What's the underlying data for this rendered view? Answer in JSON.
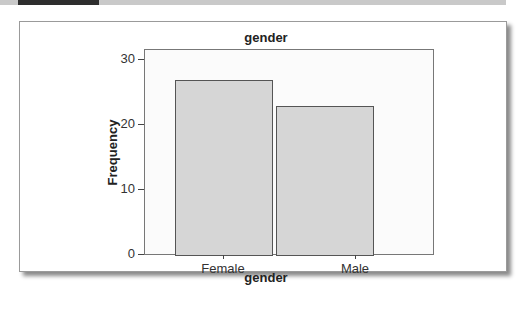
{
  "chart_data": {
    "type": "bar",
    "title": "gender",
    "categories": [
      "Female",
      "Male"
    ],
    "values": [
      27,
      23
    ],
    "xlabel": "gender",
    "ylabel": "Frequency",
    "ylim": [
      0,
      30
    ],
    "yticks": [
      0,
      10,
      20,
      30
    ],
    "grid": false,
    "legend": null,
    "bar_color": "#d6d6d6",
    "bar_edge_color": "#555555"
  },
  "axis": {
    "yticks": [
      "0",
      "10",
      "20",
      "30"
    ]
  }
}
